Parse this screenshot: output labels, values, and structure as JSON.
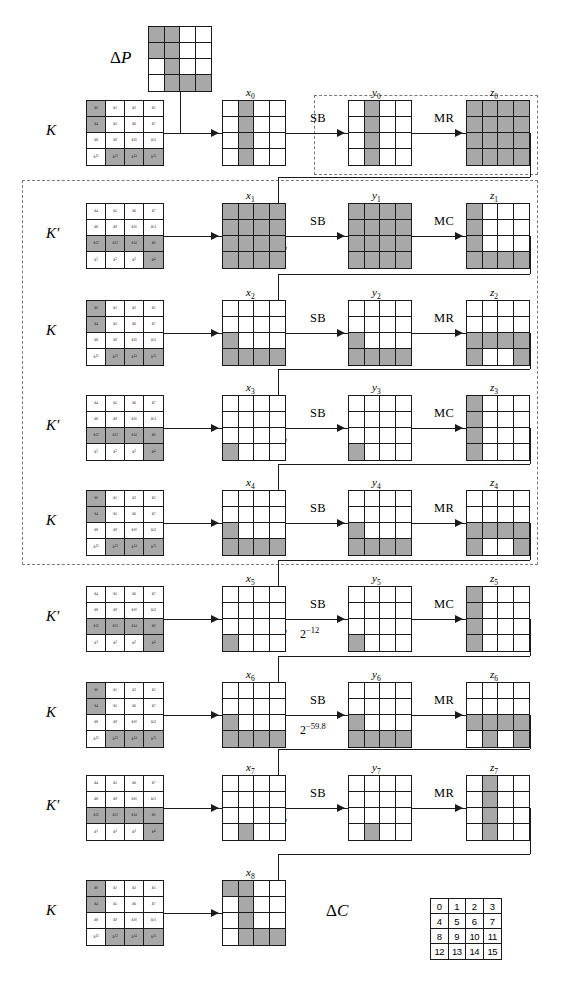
{
  "figure": {
    "title_left_top": "ΔP",
    "title_output": "ΔC",
    "round_op_labels": {
      "sb": "SB",
      "mr": "MR",
      "mc": "MC",
      "ak": "AK",
      "ak_prime": "AK'"
    },
    "key_label": "K",
    "key_prime_label": "K'",
    "probabilities": [
      {
        "round": 5,
        "value": "2",
        "exponent": "−12"
      },
      {
        "round": 6,
        "value": "2",
        "exponent": "−59.8"
      }
    ],
    "legend_cells": [
      "0",
      "1",
      "2",
      "3",
      "4",
      "5",
      "6",
      "7",
      "8",
      "9",
      "10",
      "11",
      "12",
      "13",
      "14",
      "15"
    ],
    "key_cell_labels_K": [
      "k0",
      "k1",
      "k2",
      "k3",
      "k4",
      "k5",
      "k6",
      "k7",
      "k8",
      "k9",
      "k10",
      "k11",
      "k12",
      "k13",
      "k14",
      "k15"
    ],
    "key_cell_labels_Kprime": [
      "k4",
      "k5",
      "k6",
      "k7",
      "k8",
      "k9",
      "k10",
      "k11",
      "k12",
      "k13",
      "k14",
      "k0",
      "k1",
      "k2",
      "k3",
      "k4"
    ],
    "colors": {
      "active_cell": "#a8a8a8",
      "grid_line": "#1a1a1a",
      "background": "#ffffff",
      "dashed_region": "#7a7a7a"
    },
    "state_labels": [
      "x0",
      "y0",
      "z0",
      "x1",
      "y1",
      "z1",
      "x2",
      "y2",
      "z2",
      "x3",
      "y3",
      "z3",
      "x4",
      "y4",
      "z4",
      "x5",
      "y5",
      "z5",
      "x6",
      "y6",
      "z6",
      "x7",
      "y7",
      "z7",
      "x8"
    ]
  },
  "rounds": [
    {
      "index": 0,
      "key_label": "K",
      "key_type": "K",
      "add_key_op": "AK",
      "sbox_op": "SB",
      "mix_op": "MR",
      "key_active": [
        0,
        4,
        13,
        14,
        15
      ],
      "x_active": [
        1,
        5,
        9,
        13
      ],
      "y_active": [
        1,
        5,
        9,
        13
      ],
      "z_active": [
        0,
        1,
        2,
        3,
        4,
        5,
        6,
        7,
        8,
        9,
        10,
        11,
        12,
        13,
        14,
        15
      ],
      "x_label": "x0",
      "y_label": "y0",
      "z_label": "z0",
      "probability": null
    },
    {
      "index": 1,
      "key_label": "K'",
      "key_type": "Kprime",
      "add_key_op": "AK'",
      "sbox_op": "SB",
      "mix_op": "MC",
      "key_active": [
        8,
        9,
        10,
        11,
        15
      ],
      "x_active": [
        0,
        1,
        2,
        3,
        4,
        5,
        6,
        7,
        8,
        9,
        10,
        11,
        12,
        13,
        14,
        15
      ],
      "y_active": [
        0,
        1,
        2,
        3,
        4,
        5,
        6,
        7,
        8,
        9,
        10,
        11,
        12,
        13,
        14,
        15
      ],
      "z_active": [
        0,
        4,
        8,
        12,
        13,
        14,
        15
      ],
      "x_label": "x1",
      "y_label": "y1",
      "z_label": "z1",
      "probability": null
    },
    {
      "index": 2,
      "key_label": "K",
      "key_type": "K",
      "add_key_op": "AK",
      "sbox_op": "SB",
      "mix_op": "MR",
      "key_active": [
        0,
        4,
        13,
        14,
        15
      ],
      "x_active": [
        8,
        12,
        13,
        14,
        15
      ],
      "y_active": [
        8,
        12,
        13,
        14,
        15
      ],
      "z_active": [
        8,
        9,
        10,
        11,
        12,
        15
      ],
      "x_label": "x2",
      "y_label": "y2",
      "z_label": "z2",
      "probability": null
    },
    {
      "index": 3,
      "key_label": "K'",
      "key_type": "Kprime",
      "add_key_op": "AK'",
      "sbox_op": "SB",
      "mix_op": "MC",
      "key_active": [
        8,
        9,
        10,
        11,
        15
      ],
      "x_active": [
        12
      ],
      "y_active": [
        12
      ],
      "z_active": [
        0,
        4,
        8,
        12
      ],
      "x_label": "x3",
      "y_label": "y3",
      "z_label": "z3",
      "probability": null
    },
    {
      "index": 4,
      "key_label": "K",
      "key_type": "K",
      "add_key_op": "AK",
      "sbox_op": "SB",
      "mix_op": "MR",
      "key_active": [
        0,
        4,
        13,
        14,
        15
      ],
      "x_active": [
        8,
        12,
        13,
        14,
        15
      ],
      "y_active": [
        8,
        12,
        13,
        14,
        15
      ],
      "z_active": [
        8,
        9,
        10,
        11,
        12,
        15
      ],
      "x_label": "x4",
      "y_label": "y4",
      "z_label": "z4",
      "probability": null
    },
    {
      "index": 5,
      "key_label": "K'",
      "key_type": "Kprime",
      "add_key_op": "AK'",
      "sbox_op": "SB",
      "mix_op": "MC",
      "key_active": [
        8,
        9,
        10,
        11,
        15
      ],
      "x_active": [
        12
      ],
      "y_active": [
        12
      ],
      "z_active": [
        0,
        4,
        8,
        12
      ],
      "x_label": "x5",
      "y_label": "y5",
      "z_label": "z5",
      "probability": {
        "base": "2",
        "exp": "−12"
      }
    },
    {
      "index": 6,
      "key_label": "K",
      "key_type": "K",
      "add_key_op": "AK",
      "sbox_op": "SB",
      "mix_op": "MR",
      "key_active": [
        0,
        4,
        13,
        14,
        15
      ],
      "x_active": [
        8,
        12,
        13,
        14,
        15
      ],
      "y_active": [
        8,
        12,
        13,
        14,
        15
      ],
      "z_active": [
        8,
        9,
        10,
        11,
        13,
        15
      ],
      "x_label": "x6",
      "y_label": "y6",
      "z_label": "z6",
      "probability": {
        "base": "2",
        "exp": "−59.8"
      }
    },
    {
      "index": 7,
      "key_label": "K'",
      "key_type": "Kprime",
      "add_key_op": "AK'",
      "sbox_op": "SB",
      "mix_op": "MR",
      "key_active": [
        8,
        9,
        10,
        11,
        15
      ],
      "x_active": [
        13
      ],
      "y_active": [
        13
      ],
      "z_active": [
        1,
        5,
        9,
        13
      ],
      "x_label": "x7",
      "y_label": "y7",
      "z_label": "z7",
      "probability": null
    },
    {
      "index": 8,
      "key_label": "K",
      "key_type": "K",
      "add_key_op": "AK",
      "sbox_op": null,
      "mix_op": null,
      "key_active": [
        0,
        4,
        13,
        14,
        15
      ],
      "x_active": [
        0,
        1,
        5,
        9,
        13,
        14,
        15
      ],
      "y_active": [],
      "z_active": [],
      "x_label": "x8",
      "y_label": null,
      "z_label": null,
      "probability": null
    }
  ],
  "delta_p": {
    "label": "ΔP",
    "active": [
      0,
      1,
      4,
      5,
      9,
      13,
      14,
      15
    ]
  },
  "delta_c": {
    "label": "ΔC"
  }
}
